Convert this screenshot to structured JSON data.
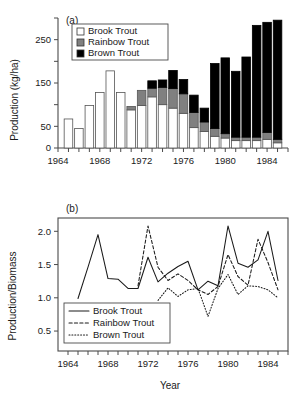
{
  "figure": {
    "panel_a_tag": "(a)",
    "panel_b_tag": "(b)"
  },
  "panel_a": {
    "ylabel": "Production (kg/ha)",
    "ytick_labels": [
      "0",
      "50",
      "150",
      "250"
    ],
    "xtick_labels": [
      "1964",
      "1968",
      "1972",
      "1976",
      "1980",
      "1984"
    ],
    "legend": [
      {
        "label": "Brook Trout",
        "color": "#ffffff"
      },
      {
        "label": "Rainbow Trout",
        "color": "#808080"
      },
      {
        "label": "Brown Trout",
        "color": "#000000"
      }
    ]
  },
  "panel_b": {
    "ylabel": "Production/Biomass",
    "xlabel": "Year",
    "ytick_labels": [
      "0.5",
      "1.0",
      "1.5",
      "2.0"
    ],
    "xtick_labels": [
      "1964",
      "1968",
      "1972",
      "1976",
      "1980",
      "1984"
    ],
    "legend": [
      {
        "label": "Brook Trout",
        "style": "solid"
      },
      {
        "label": "Rainbow Trout",
        "style": "dashed"
      },
      {
        "label": "Brown Trout",
        "style": "dotted"
      }
    ]
  },
  "chart_data": [
    {
      "type": "bar",
      "panel": "(a)",
      "stacked": true,
      "title": "",
      "xlabel": "",
      "ylabel": "Production (kg/ha)",
      "xlim": [
        1964,
        1986
      ],
      "ylim": [
        0,
        300
      ],
      "yticks": [
        0,
        50,
        150,
        250
      ],
      "ytick_minor": [
        100,
        200,
        300
      ],
      "xticks": [
        1964,
        1968,
        1972,
        1976,
        1980,
        1984
      ],
      "grid": false,
      "legend_position": "top-left",
      "categories": [
        1965,
        1966,
        1967,
        1968,
        1969,
        1970,
        1971,
        1972,
        1973,
        1974,
        1975,
        1976,
        1977,
        1978,
        1979,
        1980,
        1981,
        1982,
        1983,
        1984,
        1985
      ],
      "series": [
        {
          "name": "Brook Trout",
          "color": "#ffffff",
          "values": [
            67,
            45,
            98,
            128,
            178,
            128,
            88,
            98,
            118,
            100,
            92,
            80,
            47,
            38,
            27,
            23,
            17,
            17,
            17,
            20,
            12
          ]
        },
        {
          "name": "Rainbow Trout",
          "color": "#808080",
          "values": [
            0,
            0,
            0,
            0,
            0,
            0,
            8,
            35,
            20,
            40,
            45,
            45,
            35,
            22,
            18,
            10,
            8,
            8,
            8,
            16,
            8
          ]
        },
        {
          "name": "Brown Trout",
          "color": "#000000",
          "values": [
            0,
            0,
            0,
            0,
            0,
            0,
            0,
            0,
            17,
            17,
            42,
            33,
            40,
            32,
            150,
            175,
            152,
            185,
            258,
            254,
            275
          ]
        }
      ],
      "totals": [
        67,
        45,
        98,
        128,
        178,
        128,
        96,
        133,
        155,
        157,
        179,
        158,
        122,
        92,
        195,
        208,
        177,
        210,
        283,
        290,
        295
      ]
    },
    {
      "type": "line",
      "panel": "(b)",
      "title": "",
      "xlabel": "Year",
      "ylabel": "Production/Biomass",
      "xlim": [
        1963,
        1986
      ],
      "ylim": [
        0.2,
        2.2
      ],
      "yticks": [
        0.5,
        1.0,
        1.5,
        2.0
      ],
      "xticks": [
        1964,
        1968,
        1972,
        1976,
        1980,
        1984
      ],
      "grid": false,
      "legend_position": "bottom-left",
      "series": [
        {
          "name": "Brook Trout",
          "style": "solid",
          "x": [
            1965,
            1966,
            1967,
            1968,
            1969,
            1970,
            1971,
            1972,
            1973,
            1974,
            1975,
            1976,
            1977,
            1978,
            1979,
            1980,
            1981,
            1982,
            1983,
            1984,
            1985
          ],
          "y": [
            0.99,
            1.46,
            1.95,
            1.29,
            1.28,
            1.14,
            1.14,
            1.61,
            1.24,
            1.37,
            1.47,
            1.55,
            1.12,
            1.25,
            1.18,
            2.08,
            1.52,
            1.46,
            1.57,
            2.0,
            1.26
          ]
        },
        {
          "name": "Rainbow Trout",
          "style": "dashed",
          "x": [
            1971,
            1972,
            1973,
            1974,
            1975,
            1976,
            1977,
            1978,
            1979,
            1980,
            1981,
            1982,
            1983,
            1984,
            1985
          ],
          "y": [
            1.18,
            2.08,
            1.46,
            1.26,
            1.36,
            1.26,
            1.12,
            1.05,
            1.17,
            1.65,
            1.32,
            1.19,
            1.88,
            1.53,
            1.12
          ]
        },
        {
          "name": "Brown Trout",
          "style": "dotted",
          "x": [
            1973,
            1974,
            1975,
            1976,
            1977,
            1978,
            1979,
            1980,
            1981,
            1982,
            1983,
            1984,
            1985
          ],
          "y": [
            0.96,
            1.15,
            1.02,
            1.12,
            1.14,
            0.72,
            1.14,
            1.35,
            1.05,
            1.18,
            1.17,
            1.12,
            1.0
          ]
        }
      ]
    }
  ]
}
